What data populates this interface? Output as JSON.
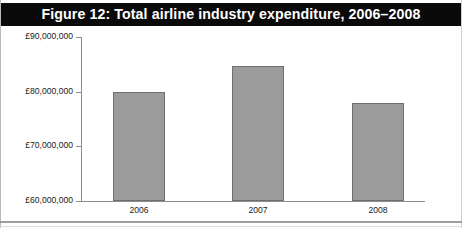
{
  "figure": {
    "title": "Figure 12: Total airline industry expenditure, 2006–2008",
    "banner_color": "#0a0a0a",
    "banner_text_color": "#ffffff"
  },
  "chart_data": {
    "type": "bar",
    "title": "Figure 12: Total airline industry expenditure, 2006–2008",
    "xlabel": "",
    "ylabel": "",
    "categories": [
      "2006",
      "2007",
      "2008"
    ],
    "values": [
      80000000,
      84700000,
      77900000
    ],
    "value_labels": [
      "£80,000,000",
      "£84,700,000",
      "£77,900,000"
    ],
    "ylim": [
      60000000,
      90000000
    ],
    "ytick_values": [
      90000000,
      80000000,
      70000000,
      60000000
    ],
    "ytick_labels": [
      "£90,000,000",
      "£80,000,000",
      "£70,000,000",
      "£60,000,000"
    ],
    "grid": false,
    "legend": false,
    "bar_fill_color": "#9b9b9b",
    "bar_border_color": "#6f6f6f",
    "axis_color": "#8d8d8d",
    "currency": "GBP"
  }
}
